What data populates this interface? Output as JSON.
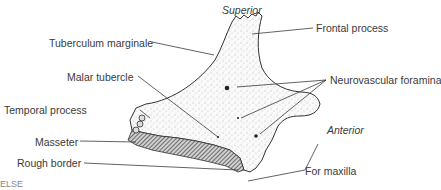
{
  "figure": {
    "orientation": {
      "top": "Superior",
      "right": "Anterior"
    },
    "labels_left": [
      {
        "text": "Tuberculum marginale"
      },
      {
        "text": "Malar tubercle"
      },
      {
        "text": "Temporal process"
      },
      {
        "text": "Masseter"
      },
      {
        "text": "Rough border"
      }
    ],
    "labels_right": [
      {
        "text": "Frontal process"
      },
      {
        "text": "Neurovascular foramina"
      },
      {
        "text": "For maxilla"
      }
    ],
    "corner_fragment": "ELSE",
    "colors": {
      "text": "#3a3a3a",
      "lines": "#3a3a3a",
      "bone_fill": "#f4f4f4",
      "hatch": "#555555"
    }
  }
}
